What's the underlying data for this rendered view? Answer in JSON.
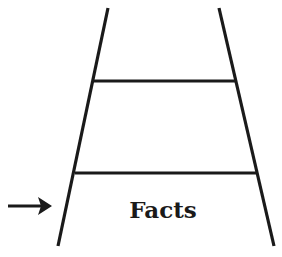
{
  "diagram": {
    "type": "ladder",
    "rungs_count": 2,
    "bottom_label": "Facts",
    "arrow_pointing_to": "Facts",
    "colors": {
      "stroke": "#1a1a1a",
      "background": "#ffffff"
    }
  }
}
